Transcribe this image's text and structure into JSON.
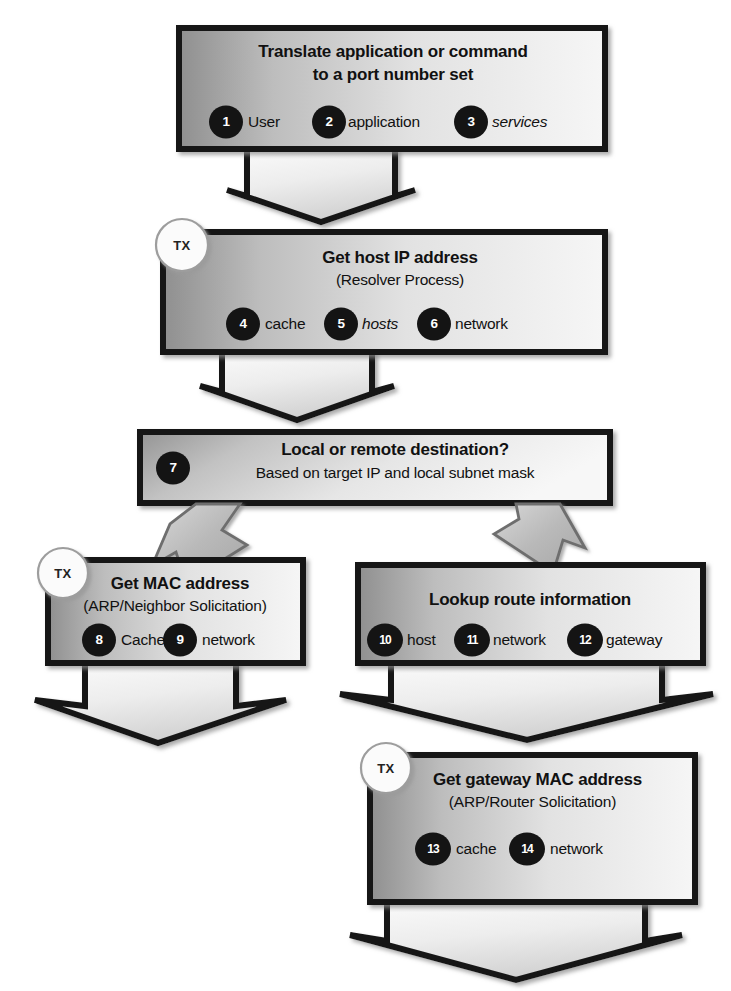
{
  "diagram": {
    "tx_badge_label": "TX",
    "colors": {
      "box_border": "#151515",
      "box_fill_dark": "#9a9a9a",
      "box_fill_light": "#f2f2f2",
      "arrow_dark_border": "#1a1a1a",
      "arrow_gray_fill": "#b5b5b5",
      "badge_fill": "#141414",
      "badge_text": "#ffffff",
      "text": "#111111",
      "page_background": "#ffffff"
    },
    "nodes": [
      {
        "id": "translate",
        "title": "Translate application or command",
        "title2": "to a port number set",
        "subtitle": "",
        "has_tx": false,
        "items": [
          {
            "num": "1",
            "label": "User",
            "italic": false
          },
          {
            "num": "2",
            "label": "application",
            "italic": false
          },
          {
            "num": "3",
            "label": "services",
            "italic": true
          }
        ]
      },
      {
        "id": "host-ip",
        "title": "Get host IP address",
        "title2": "",
        "subtitle": "(Resolver Process)",
        "has_tx": true,
        "items": [
          {
            "num": "4",
            "label": "cache",
            "italic": false
          },
          {
            "num": "5",
            "label": "hosts",
            "italic": true
          },
          {
            "num": "6",
            "label": "network",
            "italic": false
          }
        ]
      },
      {
        "id": "destination",
        "title": "Local or remote destination?",
        "title2": "",
        "subtitle": "Based on target IP  and local subnet mask",
        "has_tx": false,
        "items": [
          {
            "num": "7",
            "label": "",
            "italic": false
          }
        ]
      },
      {
        "id": "mac",
        "title": "Get MAC address",
        "title2": "",
        "subtitle": "(ARP/Neighbor Solicitation)",
        "has_tx": true,
        "items": [
          {
            "num": "8",
            "label": "Cache",
            "italic": false
          },
          {
            "num": "9",
            "label": "network",
            "italic": false
          }
        ]
      },
      {
        "id": "route",
        "title": "Lookup route information",
        "title2": "",
        "subtitle": "",
        "has_tx": false,
        "items": [
          {
            "num": "10",
            "label": "host",
            "italic": false
          },
          {
            "num": "11",
            "label": "network",
            "italic": false
          },
          {
            "num": "12",
            "label": "gateway",
            "italic": false
          }
        ]
      },
      {
        "id": "gateway-mac",
        "title": "Get gateway MAC address",
        "title2": "",
        "subtitle": "(ARP/Router Solicitation)",
        "has_tx": true,
        "items": [
          {
            "num": "13",
            "label": "cache",
            "italic": false
          },
          {
            "num": "14",
            "label": "network",
            "italic": false
          }
        ]
      }
    ],
    "connectors": [
      {
        "id": "translate-to-host-ip",
        "style": "wide-down",
        "from": "translate",
        "to": "host-ip"
      },
      {
        "id": "host-ip-to-destination",
        "style": "wide-down",
        "from": "host-ip",
        "to": "destination"
      },
      {
        "id": "destination-to-mac",
        "style": "diagonal-left",
        "from": "destination",
        "to": "mac"
      },
      {
        "id": "destination-to-route",
        "style": "diagonal-right",
        "from": "destination",
        "to": "route"
      },
      {
        "id": "mac-out",
        "style": "wide-down",
        "from": "mac",
        "to": ""
      },
      {
        "id": "route-to-gateway-mac",
        "style": "wide-down",
        "from": "route",
        "to": "gateway-mac"
      },
      {
        "id": "gateway-mac-out",
        "style": "wide-down",
        "from": "gateway-mac",
        "to": ""
      }
    ]
  }
}
